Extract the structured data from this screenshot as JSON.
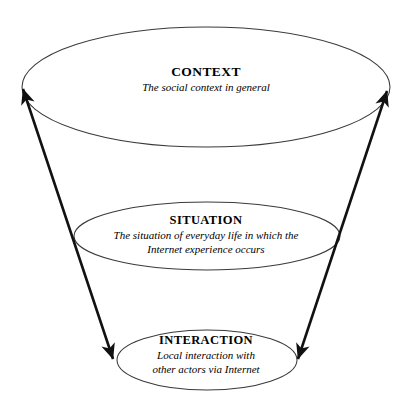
{
  "diagram": {
    "type": "nested-funnel-levels",
    "background_color": "#ffffff",
    "stroke_color": "#1a1a1a",
    "ellipse_stroke_color": "#3a3a3a",
    "text_color": "#000000",
    "levels": [
      {
        "id": "context",
        "heading": "CONTEXT",
        "caption_lines": [
          "The social context in general"
        ],
        "ellipse": {
          "cx": 206,
          "cy": 87,
          "rx": 184,
          "ry": 60
        }
      },
      {
        "id": "situation",
        "heading": "SITUATION",
        "caption_lines": [
          "The situation of everyday life in which the",
          "Internet experience occurs"
        ],
        "ellipse": {
          "cx": 207,
          "cy": 236,
          "rx": 133,
          "ry": 34
        }
      },
      {
        "id": "interaction",
        "heading": "INTERACTION",
        "caption_lines": [
          "Local interaction with",
          "other actors via Internet"
        ],
        "ellipse": {
          "cx": 207,
          "cy": 360,
          "rx": 90,
          "ry": 30
        }
      }
    ],
    "connectors": [
      {
        "id": "left-axis",
        "from_x": 22,
        "from_y": 88,
        "to_x": 114,
        "to_y": 360,
        "double_headed": true
      },
      {
        "id": "right-axis",
        "from_x": 388,
        "from_y": 90,
        "to_x": 297,
        "to_y": 360,
        "double_headed": true
      }
    ]
  }
}
